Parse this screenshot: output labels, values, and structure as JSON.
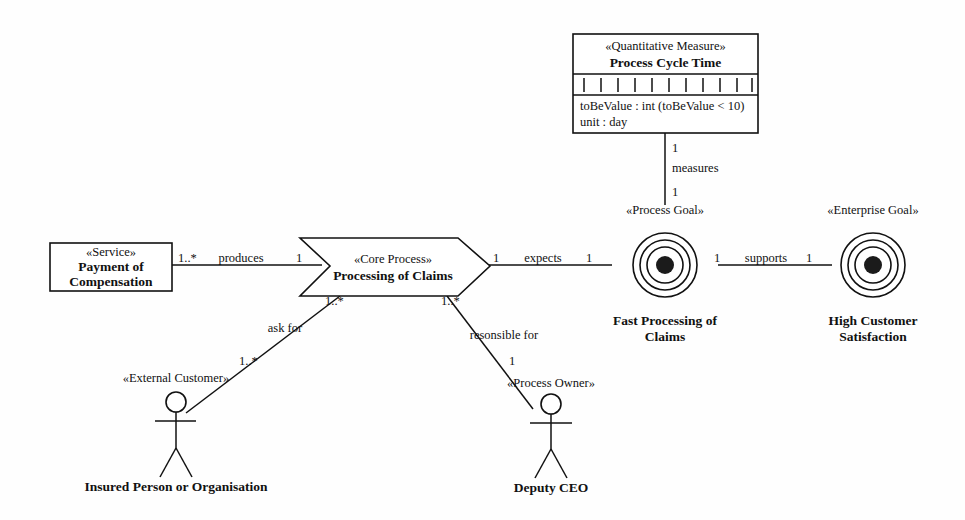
{
  "diagram": {
    "stroke_color": "#111111",
    "background_color": "#ffffff"
  },
  "nodes": {
    "measure": {
      "stereotype": "«Quantitative Measure»",
      "name": "Process Cycle Time",
      "attributes": [
        "toBeValue : int (toBeValue < 10)",
        "unit : day"
      ],
      "tick_count": 11
    },
    "service": {
      "stereotype": "«Service»",
      "name_line1": "Payment of",
      "name_line2": "Compensation"
    },
    "core_process": {
      "stereotype": "«Core Process»",
      "name": "Processing of Claims"
    },
    "process_goal": {
      "stereotype": "«Process Goal»",
      "name_line1": "Fast Processing of",
      "name_line2": "Claims",
      "ring_count": 3
    },
    "enterprise_goal": {
      "stereotype": "«Enterprise Goal»",
      "name_line1": "High Customer",
      "name_line2": "Satisfaction",
      "ring_count": 3
    },
    "external_customer": {
      "stereotype": "«External Customer»",
      "name": "Insured Person or Organisation"
    },
    "process_owner": {
      "stereotype": "«Process Owner»",
      "name": "Deputy CEO"
    }
  },
  "edges": {
    "produces": {
      "label": "produces",
      "source_multiplicity": "1..*",
      "target_multiplicity": "1"
    },
    "expects": {
      "label": "expects",
      "source_multiplicity": "1",
      "target_multiplicity": "1"
    },
    "supports": {
      "label": "supports",
      "source_multiplicity": "1",
      "target_multiplicity": "1"
    },
    "measures": {
      "label": "measures",
      "source_multiplicity": "1",
      "target_multiplicity": "1"
    },
    "ask_for": {
      "label": "ask for",
      "source_multiplicity": "1..*",
      "target_multiplicity": "1..*"
    },
    "responsible_for": {
      "label": "resonsible for",
      "source_multiplicity": "1..*",
      "target_multiplicity": "1"
    }
  }
}
